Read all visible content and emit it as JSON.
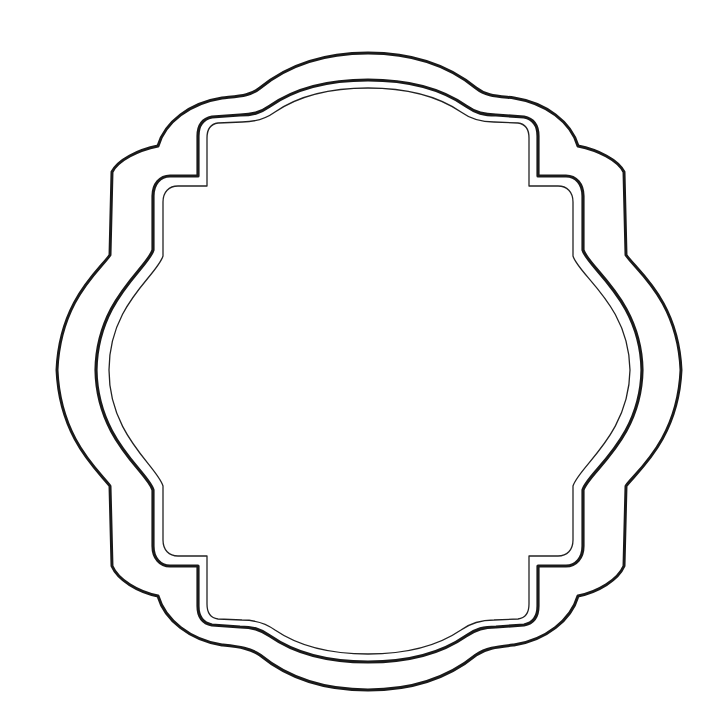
{
  "image": {
    "description": "Decorative ornamental frame / label outline, line art, blank interior",
    "background_color": "#ffffff",
    "line_color": "#1a1a1a"
  },
  "frame": {
    "layers": [
      {
        "name": "outer-border",
        "stroke_width": 3
      },
      {
        "name": "middle-border",
        "stroke_width": 3.2
      },
      {
        "name": "inner-border",
        "stroke_width": 1.3
      }
    ],
    "interior_text": ""
  }
}
